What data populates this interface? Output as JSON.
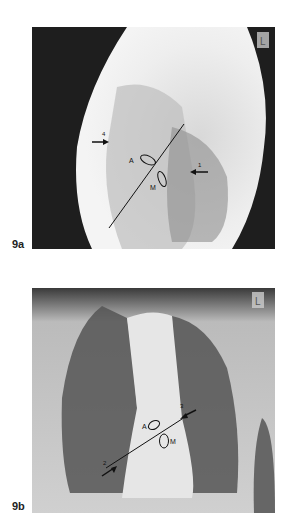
{
  "figure": {
    "panels": [
      {
        "id": "9a",
        "label": "9a",
        "view": "lateral chest radiograph",
        "marker": "L",
        "annotations": {
          "arrows": [
            "4",
            "1"
          ],
          "valves": [
            "A",
            "M"
          ]
        }
      },
      {
        "id": "9b",
        "label": "9b",
        "view": "frontal chest radiograph",
        "marker": "L",
        "annotations": {
          "arrows": [
            "3",
            "2"
          ],
          "valves": [
            "A",
            "M"
          ]
        }
      }
    ]
  }
}
